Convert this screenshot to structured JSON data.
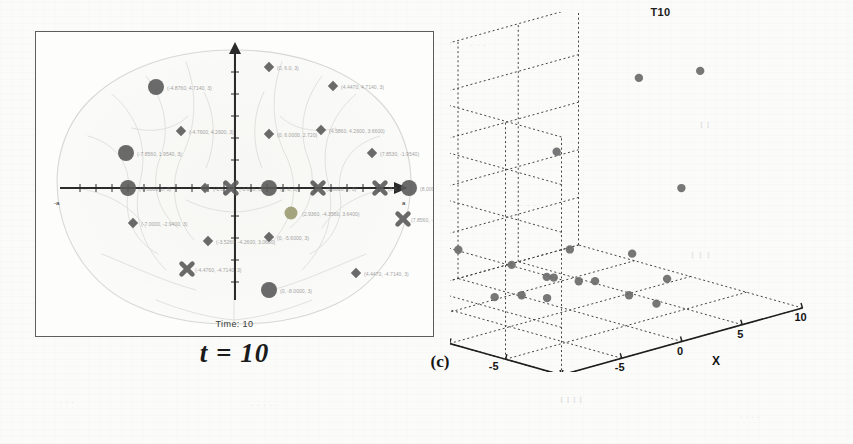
{
  "figure": {
    "caption": "(c)",
    "subcaption": "t = 10"
  },
  "brain_panel": {
    "name": "brain-topography-scatter",
    "time_label": "Time: 10",
    "axis": {
      "x_left_tick": "-a",
      "x_right_tick": "a",
      "origin": "0"
    },
    "markers": [
      {
        "shape": "circle",
        "size": "large",
        "tone": "dark",
        "x": 121,
        "y": 86,
        "label": "(-4.8760,  4.7140, 3)"
      },
      {
        "shape": "circle",
        "size": "large",
        "tone": "dark",
        "x": 91,
        "y": 152,
        "label": "(-7.8560, 1.9540, 3)"
      },
      {
        "shape": "circle",
        "size": "large",
        "tone": "dark",
        "x": 93,
        "y": 187,
        "label": "(-8.0000, 0, 3)"
      },
      {
        "shape": "circle",
        "size": "large",
        "tone": "dark",
        "x": 234,
        "y": 187,
        "label": "(0, 0, 3)"
      },
      {
        "shape": "circle",
        "size": "large",
        "tone": "dark",
        "x": 374,
        "y": 187,
        "label": "(8.0000, 0, 3)"
      },
      {
        "shape": "circle",
        "size": "large",
        "tone": "dark",
        "x": 234,
        "y": 289,
        "label": "(0, -8.0000, 3)"
      },
      {
        "shape": "circle",
        "size": "medium",
        "tone": "olive",
        "x": 256,
        "y": 212,
        "label": "(2.9360, -4.3560, 3.6400)"
      },
      {
        "shape": "diamond",
        "size": "small",
        "tone": "dark",
        "x": 234,
        "y": 66,
        "label": "(0, 6.0, 3)"
      },
      {
        "shape": "diamond",
        "size": "small",
        "tone": "dark",
        "x": 298,
        "y": 85,
        "label": "(4.4470, 4.7140, 3)"
      },
      {
        "shape": "diamond",
        "size": "small",
        "tone": "dark",
        "x": 146,
        "y": 130,
        "label": "(-4.7600, 4.2600, 3)"
      },
      {
        "shape": "diamond",
        "size": "small",
        "tone": "dark",
        "x": 286,
        "y": 129,
        "label": "(4.5860, 4.2600, 3.6600)"
      },
      {
        "shape": "diamond",
        "size": "small",
        "tone": "dark",
        "x": 337,
        "y": 152,
        "label": "(7.8530, -1.9540)"
      },
      {
        "shape": "diamond",
        "size": "small",
        "tone": "dark",
        "x": 234,
        "y": 133,
        "label": "(0, 6.0000, 2.720)"
      },
      {
        "shape": "diamond",
        "size": "small",
        "tone": "dark",
        "x": 170,
        "y": 187,
        "label": "(-2.0, 0, 3)"
      },
      {
        "shape": "diamond",
        "size": "small",
        "tone": "dark",
        "x": 98,
        "y": 222,
        "label": "(-7.0000, -2.9400, 3)"
      },
      {
        "shape": "diamond",
        "size": "small",
        "tone": "dark",
        "x": 173,
        "y": 240,
        "label": "(-3.5260, -4.2600, 3.0600)"
      },
      {
        "shape": "diamond",
        "size": "small",
        "tone": "dark",
        "x": 234,
        "y": 236,
        "label": "(0, -5.6000, 3)"
      },
      {
        "shape": "diamond",
        "size": "small",
        "tone": "dark",
        "x": 321,
        "y": 272,
        "label": "(4.4470, -4.7140, 3)"
      },
      {
        "shape": "cross",
        "size": "small",
        "tone": "dark",
        "x": 283,
        "y": 187,
        "label": "(2.0000, 0, 3)"
      },
      {
        "shape": "cross",
        "size": "small",
        "tone": "dark",
        "x": 345,
        "y": 187,
        "label": "(6.0, 0, 3)"
      },
      {
        "shape": "cross",
        "size": "small",
        "tone": "dark",
        "x": 196,
        "y": 187,
        "label": "(-1.0, 0, 3)"
      },
      {
        "shape": "cross",
        "size": "small",
        "tone": "dark",
        "x": 368,
        "y": 218,
        "label": "(7.8560, -2.9600)"
      },
      {
        "shape": "cross",
        "size": "small",
        "tone": "dark",
        "x": 152,
        "y": 268,
        "label": "(-4.4760, -4.7140, 3)"
      }
    ]
  },
  "chart_data": {
    "type": "scatter",
    "title": "T10",
    "xlabel": "X",
    "ylabel": "Y",
    "zlabel": "Z",
    "xlim": [
      -10,
      10
    ],
    "ylim": [
      -10,
      10
    ],
    "zlim": [
      0,
      1
    ],
    "xticks": [
      "-10",
      "-5",
      "0",
      "5",
      "10"
    ],
    "yticks": [
      "10",
      "5",
      "0",
      "-5",
      "-10"
    ],
    "zticks": [
      "0",
      "0.2",
      "0.4",
      "0.6",
      "0.8",
      "1"
    ],
    "grid": true,
    "legend": null,
    "marker_color": "#6b6b6b",
    "points": [
      {
        "x": 2.0,
        "y": -4.0,
        "z": 1.0
      },
      {
        "x": 5.6,
        "y": -5.6,
        "z": 1.0
      },
      {
        "x": -2.5,
        "y": -1.5,
        "z": 0.72
      },
      {
        "x": 7.2,
        "y": -2.2,
        "z": 0.44
      },
      {
        "x": -4.9,
        "y": 4.7,
        "z": 0.26
      },
      {
        "x": -0.2,
        "y": -0.2,
        "z": 0.26
      },
      {
        "x": -2.8,
        "y": 2.2,
        "z": 0.2
      },
      {
        "x": 4.6,
        "y": -0.6,
        "z": 0.18
      },
      {
        "x": -1.0,
        "y": 1.0,
        "z": 0.14
      },
      {
        "x": 1.1,
        "y": 0.4,
        "z": 0.1
      },
      {
        "x": 1.8,
        "y": -0.3,
        "z": 0.1
      },
      {
        "x": -5.8,
        "y": 6.0,
        "z": 0.1
      },
      {
        "x": 0.6,
        "y": 2.1,
        "z": 0.1
      },
      {
        "x": 6.2,
        "y": -2.0,
        "z": 0.07
      },
      {
        "x": -6.6,
        "y": 4.4,
        "z": 0.06
      },
      {
        "x": -3.0,
        "y": 3.5,
        "z": 0.05
      },
      {
        "x": -1.6,
        "y": 2.6,
        "z": 0.05
      },
      {
        "x": -0.6,
        "y": 1.4,
        "z": 0.04
      },
      {
        "x": 3.6,
        "y": -1.4,
        "z": 0.03
      },
      {
        "x": -8.0,
        "y": 7.5,
        "z": 0.02
      },
      {
        "x": -7.6,
        "y": 5.4,
        "z": 0.02
      },
      {
        "x": 4.2,
        "y": -3.2,
        "z": 0.01
      },
      {
        "x": -8.6,
        "y": 8.6,
        "z": 0.0
      },
      {
        "x": -6.4,
        "y": 8.2,
        "z": 0.0
      }
    ]
  },
  "ghost_text": [
    {
      "t": "· · ·",
      "x": 470,
      "y": 40
    },
    {
      "t": "I I",
      "x": 700,
      "y": 120
    },
    {
      "t": "· · ·",
      "x": 520,
      "y": 200
    },
    {
      "t": "1 1 1",
      "x": 690,
      "y": 250
    },
    {
      "t": ". . .",
      "x": 60,
      "y": 395
    },
    {
      "t": "· · · · ·",
      "x": 250,
      "y": 400
    },
    {
      "t": "I I I I",
      "x": 560,
      "y": 395
    },
    {
      "t": ". . . .",
      "x": 740,
      "y": 410
    }
  ]
}
